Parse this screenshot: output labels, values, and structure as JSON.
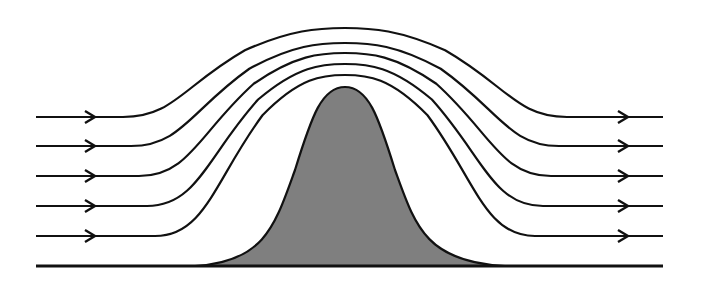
{
  "diagram": {
    "colors": {
      "line": "#111111",
      "mound_fill": "#7f7f7f",
      "background": "#ffffff"
    },
    "streamline_count": 5,
    "ground": {
      "x1": 36,
      "x2": 663,
      "y": 266
    },
    "mound": {
      "x_start": 195,
      "x_end": 505,
      "peak_x": 345,
      "peak_y": 87
    },
    "streamlines": [
      {
        "y": 117,
        "peak_y": 28
      },
      {
        "y": 146,
        "peak_y": 43
      },
      {
        "y": 176,
        "peak_y": 53
      },
      {
        "y": 206,
        "peak_y": 64
      },
      {
        "y": 236,
        "peak_y": 75
      }
    ],
    "arrows": {
      "left_x": 95,
      "right_x": 628
    }
  }
}
